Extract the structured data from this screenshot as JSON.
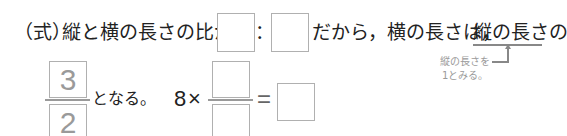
{
  "line1": {
    "prefix": "（式）",
    "text_before_boxes": "縦と横の長さの比が",
    "ratio_box_1": "",
    "colon": "：",
    "ratio_box_2": "",
    "text_after": "だから，横の長さは，",
    "underlined": "縦の長さの"
  },
  "annotation": {
    "line1": "縦の長さを",
    "line2": "1とみる。"
  },
  "line2": {
    "fraction": {
      "numerator": "3",
      "denominator": "2"
    },
    "text_after_fraction": "となる。",
    "equation": {
      "multiplier": "8",
      "times": "×",
      "fraction_numerator": "",
      "fraction_denominator": "",
      "equals": "=",
      "answer": ""
    }
  }
}
